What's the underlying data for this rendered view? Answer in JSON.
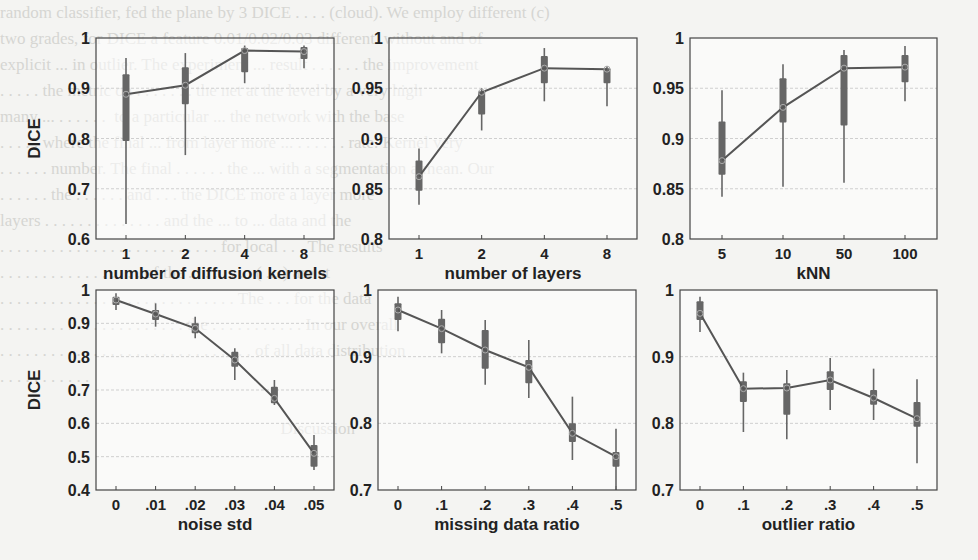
{
  "figure": {
    "y_label": "DICE",
    "bg_color": "#f4f4f2",
    "line_color": "#555555",
    "box_color": "#666666",
    "grid_color": "#cfcfcf"
  },
  "chart_data": [
    {
      "type": "line",
      "title": "",
      "xlabel": "number of diffusion kernels",
      "ylabel": "DICE",
      "categories": [
        "1",
        "2",
        "4",
        "8"
      ],
      "bold_categories": [
        "1",
        "2",
        "4",
        "8"
      ],
      "ylim": [
        0.6,
        1.0
      ],
      "yticks": [
        "0.6",
        "0.7",
        "0.8",
        "0.9",
        "1"
      ],
      "ytick_values": [
        0.6,
        0.7,
        0.8,
        0.9,
        1.0
      ],
      "grid": true,
      "series": [
        {
          "name": "median DICE",
          "values": [
            0.888,
            0.906,
            0.975,
            0.973
          ]
        }
      ],
      "boxes": [
        {
          "whisker_low": 0.63,
          "q1": 0.795,
          "q3": 0.928,
          "whisker_high": 0.96
        },
        {
          "whisker_low": 0.767,
          "q1": 0.868,
          "q3": 0.942,
          "whisker_high": 0.97
        },
        {
          "whisker_low": 0.91,
          "q1": 0.932,
          "q3": 0.98,
          "whisker_high": 0.985
        },
        {
          "whisker_low": 0.94,
          "q1": 0.958,
          "q3": 0.982,
          "whisker_high": 0.985
        }
      ]
    },
    {
      "type": "line",
      "title": "",
      "xlabel": "number of layers",
      "ylabel": "",
      "categories": [
        "1",
        "2",
        "4",
        "8"
      ],
      "ylim": [
        0.8,
        1.0
      ],
      "yticks": [
        "0.8",
        "0.85",
        "0.9",
        "0.95",
        "1"
      ],
      "ytick_values": [
        0.8,
        0.85,
        0.9,
        0.95,
        1.0
      ],
      "grid": true,
      "series": [
        {
          "name": "median DICE",
          "values": [
            0.862,
            0.946,
            0.97,
            0.969
          ]
        }
      ],
      "boxes": [
        {
          "whisker_low": 0.834,
          "q1": 0.848,
          "q3": 0.878,
          "whisker_high": 0.89
        },
        {
          "whisker_low": 0.908,
          "q1": 0.924,
          "q3": 0.947,
          "whisker_high": 0.95
        },
        {
          "whisker_low": 0.937,
          "q1": 0.955,
          "q3": 0.982,
          "whisker_high": 0.99
        },
        {
          "whisker_low": 0.932,
          "q1": 0.955,
          "q3": 0.97,
          "whisker_high": 0.972
        }
      ]
    },
    {
      "type": "line",
      "title": "",
      "xlabel": "kNN",
      "ylabel": "",
      "categories": [
        "5",
        "10",
        "50",
        "100"
      ],
      "ylim": [
        0.8,
        1.0
      ],
      "yticks": [
        "0.8",
        "0.85",
        "0.9",
        "0.95",
        "1"
      ],
      "ytick_values": [
        0.8,
        0.85,
        0.9,
        0.95,
        1.0
      ],
      "grid": true,
      "series": [
        {
          "name": "median DICE",
          "values": [
            0.878,
            0.931,
            0.97,
            0.971
          ]
        }
      ],
      "boxes": [
        {
          "whisker_low": 0.842,
          "q1": 0.864,
          "q3": 0.917,
          "whisker_high": 0.948
        },
        {
          "whisker_low": 0.852,
          "q1": 0.916,
          "q3": 0.96,
          "whisker_high": 0.974
        },
        {
          "whisker_low": 0.856,
          "q1": 0.913,
          "q3": 0.983,
          "whisker_high": 0.988
        },
        {
          "whisker_low": 0.937,
          "q1": 0.956,
          "q3": 0.983,
          "whisker_high": 0.992
        }
      ]
    },
    {
      "type": "line",
      "title": "",
      "xlabel": "noise std",
      "ylabel": "DICE",
      "categories": [
        "0",
        ".01",
        ".02",
        ".03",
        ".04",
        ".05"
      ],
      "ylim": [
        0.4,
        1.0
      ],
      "yticks": [
        "0.4",
        "0.5",
        "0.6",
        "0.7",
        "0.8",
        "0.9",
        "1"
      ],
      "ytick_values": [
        0.4,
        0.5,
        0.6,
        0.7,
        0.8,
        0.9,
        1.0
      ],
      "grid": true,
      "series": [
        {
          "name": "median DICE",
          "values": [
            0.97,
            0.928,
            0.885,
            0.79,
            0.675,
            0.51
          ]
        }
      ],
      "boxes": [
        {
          "whisker_low": 0.94,
          "q1": 0.955,
          "q3": 0.98,
          "whisker_high": 0.99
        },
        {
          "whisker_low": 0.89,
          "q1": 0.91,
          "q3": 0.94,
          "whisker_high": 0.96
        },
        {
          "whisker_low": 0.855,
          "q1": 0.87,
          "q3": 0.9,
          "whisker_high": 0.92
        },
        {
          "whisker_low": 0.73,
          "q1": 0.77,
          "q3": 0.815,
          "whisker_high": 0.825
        },
        {
          "whisker_low": 0.655,
          "q1": 0.66,
          "q3": 0.71,
          "whisker_high": 0.73
        },
        {
          "whisker_low": 0.46,
          "q1": 0.47,
          "q3": 0.535,
          "whisker_high": 0.565
        }
      ]
    },
    {
      "type": "line",
      "title": "",
      "xlabel": "missing data ratio",
      "ylabel": "",
      "categories": [
        "0",
        ".1",
        ".2",
        ".3",
        ".4",
        ".5"
      ],
      "ylim": [
        0.7,
        1.0
      ],
      "yticks": [
        "0.7",
        "0.8",
        "0.9",
        "1"
      ],
      "ytick_values": [
        0.7,
        0.8,
        0.9,
        1.0
      ],
      "grid": true,
      "series": [
        {
          "name": "median DICE",
          "values": [
            0.97,
            0.942,
            0.91,
            0.884,
            0.785,
            0.75
          ]
        }
      ],
      "boxes": [
        {
          "whisker_low": 0.938,
          "q1": 0.955,
          "q3": 0.98,
          "whisker_high": 0.99
        },
        {
          "whisker_low": 0.905,
          "q1": 0.92,
          "q3": 0.957,
          "whisker_high": 0.97
        },
        {
          "whisker_low": 0.858,
          "q1": 0.882,
          "q3": 0.94,
          "whisker_high": 0.955
        },
        {
          "whisker_low": 0.838,
          "q1": 0.86,
          "q3": 0.895,
          "whisker_high": 0.925
        },
        {
          "whisker_low": 0.745,
          "q1": 0.772,
          "q3": 0.8,
          "whisker_high": 0.84
        },
        {
          "whisker_low": 0.7,
          "q1": 0.735,
          "q3": 0.757,
          "whisker_high": 0.792
        }
      ]
    },
    {
      "type": "line",
      "title": "",
      "xlabel": "outlier ratio",
      "ylabel": "",
      "categories": [
        "0",
        ".1",
        ".2",
        ".3",
        ".4",
        ".5"
      ],
      "ylim": [
        0.7,
        1.0
      ],
      "yticks": [
        "0.7",
        "0.8",
        "0.9",
        "1"
      ],
      "ytick_values": [
        0.7,
        0.8,
        0.9,
        1.0
      ],
      "grid": true,
      "series": [
        {
          "name": "median DICE",
          "values": [
            0.965,
            0.852,
            0.853,
            0.865,
            0.838,
            0.807
          ]
        }
      ],
      "boxes": [
        {
          "whisker_low": 0.937,
          "q1": 0.955,
          "q3": 0.983,
          "whisker_high": 0.99
        },
        {
          "whisker_low": 0.787,
          "q1": 0.832,
          "q3": 0.863,
          "whisker_high": 0.876
        },
        {
          "whisker_low": 0.776,
          "q1": 0.813,
          "q3": 0.86,
          "whisker_high": 0.88
        },
        {
          "whisker_low": 0.82,
          "q1": 0.85,
          "q3": 0.878,
          "whisker_high": 0.898
        },
        {
          "whisker_low": 0.805,
          "q1": 0.828,
          "q3": 0.85,
          "whisker_high": 0.882
        },
        {
          "whisker_low": 0.74,
          "q1": 0.795,
          "q3": 0.832,
          "whisker_high": 0.866
        }
      ]
    }
  ],
  "bleed_text": "random classifier, fed the plane by 3 DICE . . . . (cloud). We employ different (c)\ntwo grades, for DICE a feature 0.01/0.02/0.03 different  without and of\nexplicit ... in outlier. The experiment ... result . . . . . . the improvement\n. . . . . the metric on . . . . . . . the net at the level by a very high\nmany ... . . . . . .  to a particular ... the network with the base\n. . . . . where the final ... from layer more ... . . . . . . rate. Kernel very\n. . . . . . number. The final . . . . . . the ... with a segmentation a mean. Our\n. . . . . . the . . . . . . and . . . the DICE more a layer more\nlayers . . . . . . . . . . . . . . and the ... to ... data and the\n. . . . . . . . . . . . . . . . . . . . . . . . . . for local . . . The results\n. . . . . . . . . . . . . . . . . of the . . . . . . . . ( ... ) are at\n. . . . . . . . . . . . . . . . . . . . . . . . . . . . The . . . for the data\n. . . . . . . . . . . . . . . . . . . . . . the . . . . . . . . . . . In our overall\n. . . . . . . . . . . . . . . . . . . . . . . . . . . . . . of all data distribution\n. . . . . . . . . . .\n\n                                                                  Discussion"
}
